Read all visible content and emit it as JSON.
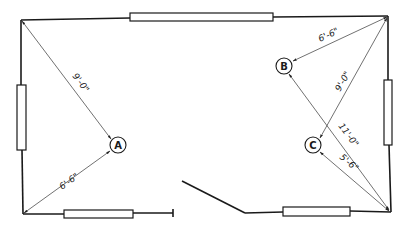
{
  "diagram": {
    "type": "floor-plan-measurements",
    "points": [
      {
        "id": "A",
        "label": "A"
      },
      {
        "id": "B",
        "label": "B"
      },
      {
        "id": "C",
        "label": "C"
      }
    ],
    "measurements": [
      {
        "from": "top-left-corner",
        "to": "A",
        "label": "9'-0\""
      },
      {
        "from": "bottom-left-corner",
        "to": "A",
        "label": "6'-6\""
      },
      {
        "from": "top-right-corner",
        "to": "B",
        "label": "6'-6\""
      },
      {
        "from": "bottom-right-corner",
        "to": "B",
        "label": "9'-0\""
      },
      {
        "from": "top-right-corner",
        "to": "C",
        "label": "11'-0\""
      },
      {
        "from": "bottom-right-corner",
        "to": "C",
        "label": "5'-6\""
      }
    ],
    "colors": {
      "line": "#1a1a1a",
      "background": "#ffffff"
    }
  }
}
